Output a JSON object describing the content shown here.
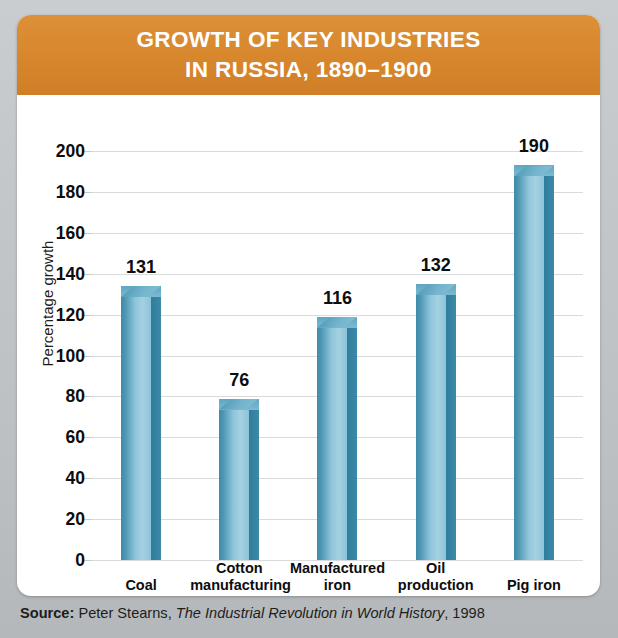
{
  "header": {
    "title_line1": "GROWTH OF KEY INDUSTRIES",
    "title_line2": "IN RUSSIA, 1890–1900",
    "background_color": "#d8872d",
    "text_color": "#ffffff"
  },
  "source": {
    "label": "Source:",
    "author": "Peter Stearns,",
    "work": "The Industrial Revolution in World History",
    "year": ", 1998"
  },
  "chart_data": {
    "type": "bar",
    "title": "GROWTH OF KEY INDUSTRIES IN RUSSIA, 1890–1900",
    "xlabel": "",
    "ylabel": "Percentage growth",
    "ylim": [
      0,
      200
    ],
    "ytick_step": 20,
    "yticks": [
      200,
      180,
      160,
      140,
      120,
      100,
      80,
      60,
      40,
      20,
      0
    ],
    "grid": true,
    "legend": "none",
    "bar_color": "#7db9d1",
    "bar_shadow_color": "#3f8aa8",
    "categories": [
      "Coal",
      "Cotton manufacturing",
      "Manufactured iron",
      "Oil production",
      "Pig iron"
    ],
    "category_lines": [
      [
        "Coal",
        ""
      ],
      [
        "Cotton",
        "manufacturing"
      ],
      [
        "Manufactured",
        "iron"
      ],
      [
        "Oil",
        "production"
      ],
      [
        "Pig iron",
        ""
      ]
    ],
    "values": [
      131,
      76,
      116,
      132,
      190
    ],
    "value_labels": [
      "131",
      "76",
      "116",
      "132",
      "190"
    ]
  }
}
